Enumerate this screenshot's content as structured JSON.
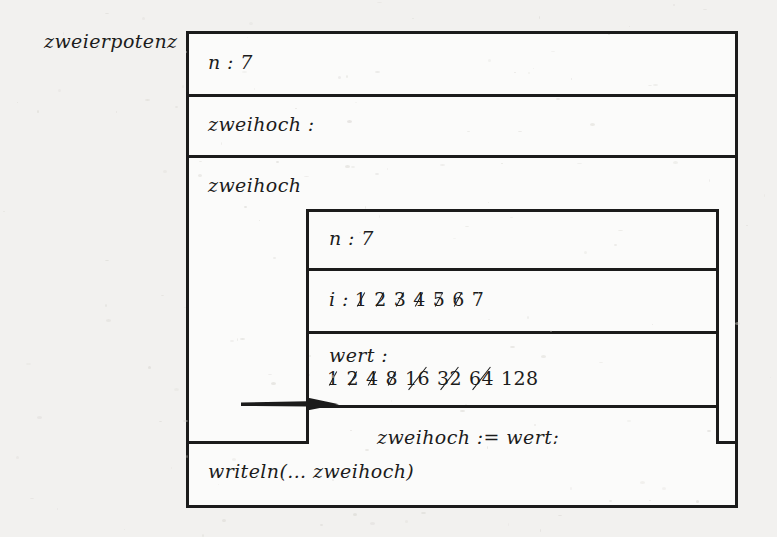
{
  "diagram": {
    "name": "zweierpotenz",
    "type": "nassi-shneiderman-structogram"
  },
  "outer": {
    "rows": [
      {
        "label": "n : 7"
      },
      {
        "label": "zweihoch :"
      },
      {
        "label": "zweihoch"
      },
      {
        "label": "writeln(... zweihoch)"
      }
    ]
  },
  "inner": {
    "n_label": "n : 7",
    "i_label": "i :",
    "i_values": [
      {
        "text": "1",
        "struck": true
      },
      {
        "text": "2",
        "struck": true
      },
      {
        "text": "3",
        "struck": true
      },
      {
        "text": "4",
        "struck": true
      },
      {
        "text": "5",
        "struck": true
      },
      {
        "text": "6",
        "struck": true
      },
      {
        "text": "7",
        "struck": false
      }
    ],
    "wert_label": "wert :",
    "wert_values": [
      {
        "text": "1",
        "struck": true
      },
      {
        "text": "2",
        "struck": true
      },
      {
        "text": "4",
        "struck": true
      },
      {
        "text": "8",
        "struck": true
      },
      {
        "text": "16",
        "struck": true
      },
      {
        "text": "32",
        "struck": true
      },
      {
        "text": "64",
        "struck": true
      },
      {
        "text": "128",
        "struck": false
      }
    ],
    "assignment": "zweihoch := wert;"
  },
  "annotation": {
    "arrow": "arrow pointing to assignment row"
  },
  "colors": {
    "ink": "#1c1c1c",
    "paper": "#fbfbfa",
    "page_background": "#f2f1ef"
  }
}
